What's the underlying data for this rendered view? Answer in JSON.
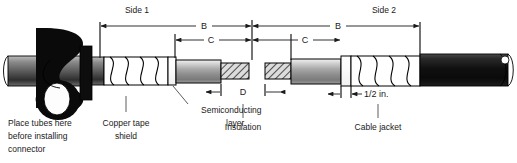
{
  "figure": {
    "background": "#ffffff",
    "ink": "#1a1a1a"
  },
  "dimensions": {
    "side1_label": "Side 1",
    "side2_label": "Side 2",
    "b_left": "B",
    "c_left": "C",
    "b_right": "B",
    "c_right": "C",
    "d_label": "D",
    "half_inch_label": "1/2 in."
  },
  "callouts": {
    "place_tubes": "Place tubes here\nbefore installing\nconnector",
    "place_tubes_line1": "Place tubes here",
    "place_tubes_line2": "before installing",
    "place_tubes_line3": "connector",
    "copper_tape_line1": "Copper tape",
    "copper_tape_line2": "shield",
    "semiconducting_line1": "Semiconducting",
    "semiconducting_line2": "layer",
    "insulation": "Insulation",
    "cable_jacket": "Cable jacket"
  },
  "parts": [
    {
      "name": "cable-jacket-left",
      "label": "Cable jacket",
      "color": "#111111"
    },
    {
      "name": "copper-tape-shield",
      "label": "Copper tape shield",
      "color": "#ffffff"
    },
    {
      "name": "semiconducting-layer",
      "label": "Semiconducting layer",
      "color": "#ffffff"
    },
    {
      "name": "insulation",
      "label": "Insulation",
      "color": "#9a9a9a"
    },
    {
      "name": "conductor-hatched",
      "label": "Conductor",
      "color": "#cccccc"
    },
    {
      "name": "cable-jacket-right",
      "label": "Cable jacket",
      "color": "#111111"
    }
  ],
  "colors": {
    "jacket_dark": "#151515",
    "insulation_mid": "#9b9b9b",
    "insulation_light": "#e9e9e9",
    "hatch_fill": "#d8d8d8",
    "white": "#ffffff",
    "line": "#1a1a1a"
  }
}
